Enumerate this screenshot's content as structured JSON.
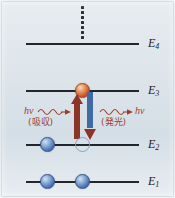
{
  "figure": {
    "background_top_color": "#e7edf1",
    "background_bottom_color": "#e8eef2",
    "line_color": "#23262b",
    "absorption_color": "#8c3527",
    "emission_color": "#3f6aa4",
    "photon_label_color": "#a0402c"
  },
  "levels": [
    {
      "id": "E4",
      "label": "E",
      "sub": "4",
      "y": 43
    },
    {
      "id": "E3",
      "label": "E",
      "sub": "3",
      "y": 90
    },
    {
      "id": "E2",
      "label": "E",
      "sub": "2",
      "y": 144
    },
    {
      "id": "E1",
      "label": "E",
      "sub": "1",
      "y": 181
    }
  ],
  "particles": {
    "e3_excited": {
      "type": "orange-sphere",
      "level": "E3"
    },
    "e2_occupied": {
      "type": "blue-sphere",
      "level": "E2"
    },
    "e2_vacancy": {
      "type": "hollow-circle",
      "level": "E2"
    },
    "e1_left": {
      "type": "blue-sphere",
      "level": "E1"
    },
    "e1_right": {
      "type": "blue-sphere",
      "level": "E1"
    }
  },
  "transitions": {
    "absorption": {
      "direction": "up",
      "from": "E2",
      "to": "E3",
      "photon_symbol": "hν",
      "process_label": "(吸収)",
      "color": "#8c3527"
    },
    "emission": {
      "direction": "down",
      "from": "E3",
      "to": "E2",
      "photon_symbol": "hν",
      "process_label": "(発光)",
      "color": "#3f6aa4"
    }
  },
  "continuation": {
    "marker": "vertical-dotted-line",
    "meaning": "higher levels continue above E4"
  }
}
